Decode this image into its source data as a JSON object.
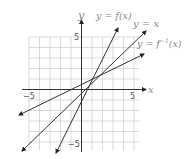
{
  "chart_data": {
    "type": "line",
    "title": "",
    "xlabel": "x",
    "ylabel": "y",
    "xlim": [
      -5,
      5.5
    ],
    "ylim": [
      -5.8,
      5
    ],
    "grid": true,
    "x_tick_labels": [
      "-5",
      "5"
    ],
    "y_tick_labels": [
      "5",
      "-5"
    ],
    "series": [
      {
        "name": "y = f(x)",
        "equation": "y = 2x - 1",
        "points": [
          [
            -2.4,
            -5.8
          ],
          [
            3.6,
            6.0
          ]
        ]
      },
      {
        "name": "y = x",
        "equation": "y = x",
        "points": [
          [
            -5.6,
            -5.9
          ],
          [
            6.2,
            5.5
          ]
        ]
      },
      {
        "name": "y = f⁻¹(x)",
        "equation": "y = (x + 1) / 2",
        "points": [
          [
            -6.0,
            -2.5
          ],
          [
            6.0,
            3.4
          ]
        ]
      }
    ],
    "intersection": [
      1,
      1
    ],
    "annotations": [
      "y = f(x)",
      "y = x",
      "y = f⁻¹(x)"
    ]
  },
  "labels": {
    "y_axis": "y",
    "x_axis": "x",
    "f": "y = f(x)",
    "identity": "y = x",
    "inverse_prefix": "y = f",
    "inverse_sup": "−1",
    "inverse_suffix": "(x)",
    "tick_x_neg": "−5",
    "tick_x_pos": "5",
    "tick_y_pos": "5",
    "tick_y_neg": "−5"
  },
  "colors": {
    "grid": "#cccccc",
    "axis": "#222222",
    "line": "#333333"
  }
}
